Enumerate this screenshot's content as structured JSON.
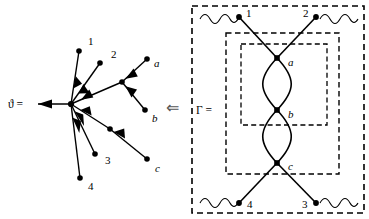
{
  "figure": {
    "width": 369,
    "height": 219,
    "background": "#ffffff",
    "ink": "#000000"
  },
  "left_panel": {
    "name": "tree-diagram",
    "equation_label": "ϑ =",
    "root_arrow_label": "root-outgoing-edge",
    "leaf_labels": [
      "1",
      "2",
      "a",
      "b",
      "3",
      "4",
      "c"
    ],
    "nodes": [
      {
        "id": "root",
        "label": "",
        "x": 71,
        "y": 104
      },
      {
        "id": "n1",
        "label": "1",
        "x": 79,
        "y": 51,
        "label_x": 88,
        "label_y": 45
      },
      {
        "id": "n2",
        "label": "2",
        "x": 100,
        "y": 63,
        "label_x": 111,
        "label_y": 58
      },
      {
        "id": "hub_ab",
        "label": "",
        "x": 122,
        "y": 82
      },
      {
        "id": "na",
        "label": "a",
        "x": 147,
        "y": 59,
        "label_x": 154,
        "label_y": 67
      },
      {
        "id": "nb",
        "label": "b",
        "x": 145,
        "y": 110,
        "label_x": 152,
        "label_y": 122
      },
      {
        "id": "n3",
        "label": "3",
        "x": 95,
        "y": 154,
        "label_x": 105,
        "label_y": 164
      },
      {
        "id": "n4",
        "label": "4",
        "x": 80,
        "y": 178,
        "label_x": 88,
        "label_y": 190
      },
      {
        "id": "hub_c",
        "label": "",
        "x": 110,
        "y": 129
      },
      {
        "id": "nc",
        "label": "c",
        "x": 147,
        "y": 159,
        "label_x": 155,
        "label_y": 172
      }
    ],
    "edges": [
      {
        "from": "root",
        "to": "out",
        "arrow": "toward-out"
      },
      {
        "from": "n1",
        "to": "root",
        "arrow": "toward-root"
      },
      {
        "from": "n2",
        "to": "root",
        "arrow": "toward-root"
      },
      {
        "from": "hub_ab",
        "to": "root",
        "arrow": "toward-root"
      },
      {
        "from": "na",
        "to": "hub_ab",
        "arrow": "toward-hub"
      },
      {
        "from": "nb",
        "to": "hub_ab",
        "arrow": "toward-hub"
      },
      {
        "from": "n3",
        "to": "root",
        "arrow": "toward-root"
      },
      {
        "from": "n4",
        "to": "root",
        "arrow": "toward-root"
      },
      {
        "from": "hub_c",
        "to": "root",
        "arrow": "toward-root"
      },
      {
        "from": "nc",
        "to": "hub_c",
        "arrow": "toward-hub"
      }
    ]
  },
  "implies_arrow": {
    "name": "implies-left-arrow",
    "glyph": "⇐"
  },
  "right_panel": {
    "name": "feynman-graph",
    "equation_label": "Γ =",
    "external_leg_labels": [
      "1",
      "2",
      "4",
      "3"
    ],
    "vertex_labels": [
      "a",
      "b",
      "c"
    ],
    "nodes": [
      {
        "id": "e1",
        "label": "1",
        "x": 239,
        "y": 17,
        "label_x": 247,
        "label_y": 14
      },
      {
        "id": "e2",
        "label": "2",
        "x": 316,
        "y": 17,
        "label_x": 304,
        "label_y": 14
      },
      {
        "id": "va",
        "label": "a",
        "x": 277,
        "y": 58,
        "label_x": 289,
        "label_y": 65
      },
      {
        "id": "vb",
        "label": "b",
        "x": 277,
        "y": 110,
        "label_x": 289,
        "label_y": 117
      },
      {
        "id": "vc",
        "label": "c",
        "x": 277,
        "y": 163,
        "label_x": 289,
        "label_y": 170
      },
      {
        "id": "e4",
        "label": "4",
        "x": 239,
        "y": 203,
        "label_x": 248,
        "label_y": 207
      },
      {
        "id": "e3",
        "label": "3",
        "x": 316,
        "y": 203,
        "label_x": 303,
        "label_y": 207
      }
    ],
    "boxes": [
      {
        "name": "outer-dashed-box",
        "x": 192,
        "y": 6,
        "w": 172,
        "h": 207
      },
      {
        "name": "middle-dashed-box",
        "x": 226,
        "y": 33,
        "w": 113,
        "h": 141
      },
      {
        "name": "inner-dashed-box",
        "x": 241,
        "y": 44,
        "w": 86,
        "h": 81
      }
    ],
    "wavy_legs": [
      "top-left-wave",
      "top-right-wave",
      "bottom-left-wave",
      "bottom-right-wave"
    ]
  }
}
